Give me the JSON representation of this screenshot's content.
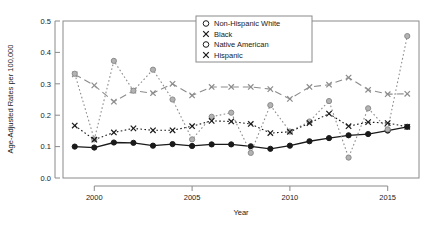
{
  "chart_data": {
    "type": "line",
    "title": "",
    "xlabel": "Year",
    "ylabel": "Age-Adjusted Rates per 100,000",
    "xlim": [
      1998.4,
      1998.4
    ],
    "ylim": [
      0.0,
      0.5
    ],
    "grid": false,
    "legend_position": "top-right",
    "x": [
      1999,
      2000,
      2001,
      2002,
      2003,
      2004,
      2005,
      2006,
      2007,
      2008,
      2009,
      2010,
      2011,
      2012,
      2013,
      2014,
      2015,
      2016
    ],
    "xticks": [
      2000,
      2005,
      2010,
      2015
    ],
    "xtick_labels": [
      "2000",
      "2005",
      "2010",
      "2015"
    ],
    "yticks": [
      0.0,
      0.1,
      0.2,
      0.3,
      0.4,
      0.5
    ],
    "ytick_labels": [
      "0.0",
      "0.1",
      "0.2",
      "0.3",
      "0.4",
      "0.5"
    ],
    "series": [
      {
        "name": "Non-Hispanic White",
        "marker": "circle",
        "line": "solid",
        "color": "#1a1a1a",
        "values": [
          0.1,
          0.097,
          0.113,
          0.112,
          0.103,
          0.108,
          0.102,
          0.107,
          0.107,
          0.101,
          0.093,
          0.103,
          0.117,
          0.127,
          0.136,
          0.14,
          0.151,
          0.163
        ]
      },
      {
        "name": "Black",
        "marker": "cross",
        "line": "dashed",
        "color": "#8c8c8c",
        "values": [
          0.33,
          0.295,
          0.243,
          0.278,
          0.27,
          0.3,
          0.263,
          0.29,
          0.29,
          0.29,
          0.283,
          0.252,
          0.29,
          0.297,
          0.32,
          0.281,
          0.267,
          0.268
        ]
      },
      {
        "name": "Native American",
        "marker": "circle",
        "line": "dotted",
        "color": "#8c8c8c",
        "values": [
          0.332,
          0.123,
          0.373,
          0.278,
          0.345,
          0.25,
          0.123,
          0.195,
          0.208,
          0.08,
          0.232,
          0.148,
          0.18,
          0.245,
          0.065,
          0.222,
          0.155,
          0.452
        ]
      },
      {
        "name": "Hispanic",
        "marker": "cross",
        "line": "dotted",
        "color": "#1a1a1a",
        "values": [
          0.167,
          0.122,
          0.145,
          0.158,
          0.152,
          0.152,
          0.165,
          0.182,
          0.18,
          0.172,
          0.143,
          0.147,
          0.175,
          0.205,
          0.165,
          0.178,
          0.175,
          0.163
        ]
      }
    ]
  },
  "legend": {
    "entries": [
      {
        "label": "Non-Hispanic White",
        "marker": "circle"
      },
      {
        "label": "Black",
        "marker": "cross"
      },
      {
        "label": "Native American",
        "marker": "circle"
      },
      {
        "label": "Hispanic",
        "marker": "cross"
      }
    ]
  }
}
